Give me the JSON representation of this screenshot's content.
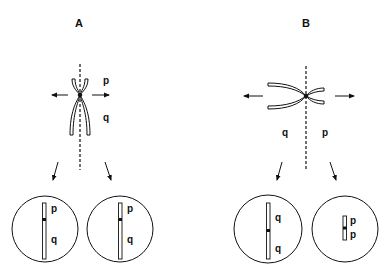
{
  "figure": {
    "ink_color": "#111111",
    "background": "#ffffff",
    "panels": [
      {
        "id": "A",
        "title": "A",
        "description": "Chromosome with centromere splitting along vertical axis; short p-arm above, long q-arm below; normal longitudinal division",
        "top_labels": {
          "upper": "p",
          "lower": "q"
        },
        "daughter_cells": [
          {
            "labels": [
              "p",
              "q"
            ],
            "chromosome": "normal, p above q"
          },
          {
            "labels": [
              "p",
              "q"
            ],
            "chromosome": "normal, p above q"
          }
        ]
      },
      {
        "id": "B",
        "title": "B",
        "description": "Centromere divides transversely (misdivision); q-arms go left, p-arms go right producing isochromosomes",
        "top_labels": {
          "left": "q",
          "right": "p"
        },
        "daughter_cells": [
          {
            "labels": [
              "q",
              "q"
            ],
            "chromosome": "isochromosome q"
          },
          {
            "labels": [
              "p",
              "p"
            ],
            "chromosome": "isochromosome p"
          }
        ]
      }
    ]
  }
}
